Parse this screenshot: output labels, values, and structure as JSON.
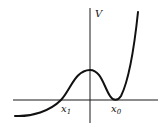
{
  "diagram": {
    "type": "potential-energy-curve",
    "colors": {
      "axis": "#1a1a1a",
      "curve": "#111111",
      "background": "#ffffff"
    },
    "axes": {
      "vertical_label": "V",
      "horizontal_axis": {
        "x1": 13,
        "x2": 158,
        "y": 100
      },
      "vertical_axis": {
        "x": 90,
        "y1": 8,
        "y2": 123
      }
    },
    "labels": {
      "y_axis": "V",
      "x1_base": "x",
      "x1_sub": "1",
      "x0_base": "x",
      "x0_sub": "0"
    },
    "features": {
      "left_zero_crossing": "x1",
      "local_maximum_at": "origin",
      "local_minimum_touching_axis": "x0"
    }
  }
}
